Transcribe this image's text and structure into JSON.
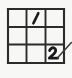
{
  "figure": {
    "background_color": "#f7f7f5",
    "ink_color": "#1a1a1a",
    "grid_color": "#2b2b2b"
  },
  "grid": {
    "rows": 3,
    "columns": 3,
    "left": 8,
    "top": 9,
    "right": 64,
    "bottom": 63,
    "column_dividers": [
      26.5,
      45.5
    ],
    "row_dividers": [
      27,
      44.5
    ],
    "cells": [
      {
        "row": 1,
        "column": 1,
        "value": "",
        "name": "cell-r1c1"
      },
      {
        "row": 1,
        "column": 2,
        "value": "1",
        "name": "cell-r1c2"
      },
      {
        "row": 1,
        "column": 3,
        "value": "",
        "name": "cell-r1c3"
      },
      {
        "row": 2,
        "column": 1,
        "value": "",
        "name": "cell-r2c1"
      },
      {
        "row": 2,
        "column": 2,
        "value": "",
        "name": "cell-r2c2"
      },
      {
        "row": 2,
        "column": 3,
        "value": "",
        "name": "cell-r2c3"
      },
      {
        "row": 3,
        "column": 1,
        "value": "",
        "name": "cell-r3c1"
      },
      {
        "row": 3,
        "column": 2,
        "value": "",
        "name": "cell-r3c2"
      },
      {
        "row": 3,
        "column": 3,
        "value": "2",
        "name": "cell-r3c3"
      }
    ]
  },
  "annotations": {
    "digit_one": {
      "label": "1",
      "cell": "row 1, column 2",
      "style": "handwritten slanted stroke"
    },
    "digit_two": {
      "label": "2",
      "cell": "row 3, column 3",
      "style": "handwritten bold stroke"
    },
    "pointer": {
      "label": "diagonal pen stroke",
      "from": "bottom-right cell",
      "to": "outside grid, upper right"
    }
  }
}
